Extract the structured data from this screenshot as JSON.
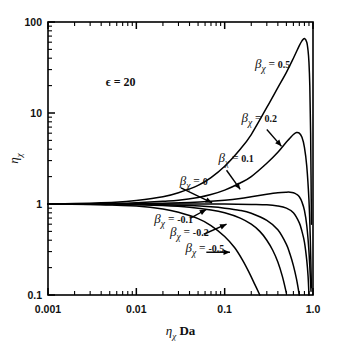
{
  "chart_data": {
    "type": "line",
    "title": "",
    "xlabel": "ηχ Da",
    "ylabel": "ηχ",
    "xscale": "log",
    "yscale": "log",
    "xlim": [
      0.001,
      1.0
    ],
    "ylim": [
      0.1,
      100
    ],
    "xticks": [
      "0.001",
      "0.01",
      "0.1",
      "1.0"
    ],
    "yticks": [
      "0.1",
      "1",
      "10",
      "100"
    ],
    "grid": false,
    "legend_position": "inline-annotations",
    "annotations": [
      {
        "name": "epsilon-annotation",
        "text": "ϵ = 20",
        "x": 0.0045,
        "y": 20
      },
      {
        "name": "beta-0.5-label",
        "text": "βχ = 0.5",
        "x": 0.22,
        "y": 31
      },
      {
        "name": "beta-0.2-label",
        "text": "βχ = 0.2",
        "x": 0.155,
        "y": 8.0
      },
      {
        "name": "beta-0.1-label",
        "text": "βχ = 0.1",
        "x": 0.085,
        "y": 2.9
      },
      {
        "name": "beta-0-label",
        "text": "βχ = 0",
        "x": 0.031,
        "y": 1.62
      },
      {
        "name": "beta-neg0.1-label",
        "text": "βχ = -0.1",
        "x": 0.016,
        "y": 0.62
      },
      {
        "name": "beta-neg0.2-label",
        "text": "βχ = -0.2",
        "x": 0.024,
        "y": 0.44
      },
      {
        "name": "beta-neg0.5-label",
        "text": "βχ = -0.5",
        "x": 0.036,
        "y": 0.295
      }
    ],
    "series": [
      {
        "name": "beta = 0.5",
        "label": "βχ = 0.5",
        "color": "#000000",
        "x": [
          0.001,
          0.002,
          0.004,
          0.007,
          0.01,
          0.02,
          0.03,
          0.05,
          0.07,
          0.1,
          0.15,
          0.2,
          0.3,
          0.4,
          0.5,
          0.6,
          0.7,
          0.75,
          0.8,
          0.85,
          0.88,
          0.9,
          0.92,
          0.94,
          0.96
        ],
        "y": [
          1.0,
          1.01,
          1.03,
          1.06,
          1.09,
          1.2,
          1.33,
          1.6,
          1.95,
          2.6,
          4.0,
          5.8,
          11.5,
          19,
          28,
          40,
          55,
          62,
          66,
          60,
          48,
          36,
          20,
          6,
          0.6
        ]
      },
      {
        "name": "beta = 0.2",
        "label": "βχ = 0.2",
        "color": "#000000",
        "x": [
          0.001,
          0.002,
          0.004,
          0.007,
          0.01,
          0.02,
          0.03,
          0.05,
          0.07,
          0.1,
          0.15,
          0.2,
          0.3,
          0.4,
          0.5,
          0.55,
          0.6,
          0.65,
          0.7,
          0.75,
          0.8,
          0.85,
          0.9,
          0.93,
          0.96
        ],
        "y": [
          1.0,
          1.0,
          1.01,
          1.02,
          1.03,
          1.07,
          1.1,
          1.18,
          1.27,
          1.42,
          1.7,
          2.0,
          2.8,
          3.7,
          4.8,
          5.3,
          5.8,
          6.1,
          6.0,
          5.4,
          4.2,
          2.6,
          1.1,
          0.45,
          0.12
        ]
      },
      {
        "name": "beta = 0.1",
        "label": "βχ = 0.1",
        "color": "#000000",
        "x": [
          0.001,
          0.002,
          0.005,
          0.01,
          0.02,
          0.04,
          0.07,
          0.1,
          0.15,
          0.2,
          0.3,
          0.4,
          0.5,
          0.55,
          0.6,
          0.65,
          0.7,
          0.75,
          0.8,
          0.85,
          0.9,
          0.95
        ],
        "y": [
          1.0,
          1.0,
          1.0,
          1.01,
          1.02,
          1.04,
          1.07,
          1.1,
          1.15,
          1.2,
          1.28,
          1.33,
          1.35,
          1.35,
          1.33,
          1.28,
          1.2,
          1.05,
          0.85,
          0.58,
          0.3,
          0.11
        ]
      },
      {
        "name": "beta = 0",
        "label": "βχ = 0",
        "color": "#000000",
        "x": [
          0.001,
          0.005,
          0.01,
          0.03,
          0.06,
          0.1,
          0.2,
          0.3,
          0.4,
          0.5,
          0.6,
          0.7,
          0.75,
          0.8,
          0.85,
          0.88,
          0.9
        ],
        "y": [
          1.0,
          1.0,
          1.0,
          1.0,
          1.0,
          1.0,
          0.99,
          0.98,
          0.95,
          0.9,
          0.8,
          0.62,
          0.5,
          0.38,
          0.24,
          0.16,
          0.1
        ]
      },
      {
        "name": "beta = -0.1",
        "label": "βχ = -0.1",
        "color": "#000000",
        "x": [
          0.001,
          0.005,
          0.01,
          0.02,
          0.04,
          0.07,
          0.1,
          0.15,
          0.2,
          0.3,
          0.4,
          0.5,
          0.55,
          0.6,
          0.65,
          0.7
        ],
        "y": [
          1.0,
          1.0,
          0.99,
          0.98,
          0.96,
          0.93,
          0.9,
          0.85,
          0.79,
          0.66,
          0.52,
          0.36,
          0.28,
          0.21,
          0.15,
          0.1
        ]
      },
      {
        "name": "beta = -0.2",
        "label": "βχ = -0.2",
        "color": "#000000",
        "x": [
          0.001,
          0.005,
          0.01,
          0.02,
          0.04,
          0.07,
          0.1,
          0.15,
          0.2,
          0.25,
          0.3,
          0.35,
          0.4,
          0.45,
          0.5
        ],
        "y": [
          1.0,
          0.99,
          0.98,
          0.96,
          0.92,
          0.86,
          0.8,
          0.7,
          0.6,
          0.5,
          0.4,
          0.31,
          0.23,
          0.16,
          0.105
        ]
      },
      {
        "name": "beta = -0.5",
        "label": "βχ = -0.5",
        "color": "#000000",
        "x": [
          0.001,
          0.003,
          0.006,
          0.01,
          0.02,
          0.03,
          0.05,
          0.07,
          0.1,
          0.13,
          0.16,
          0.19,
          0.22,
          0.25
        ],
        "y": [
          1.0,
          0.99,
          0.97,
          0.95,
          0.88,
          0.81,
          0.69,
          0.58,
          0.44,
          0.33,
          0.24,
          0.175,
          0.13,
          0.1
        ]
      }
    ]
  },
  "figure": {
    "background": "#ffffff",
    "line_color": "#000000",
    "axis_color": "#000000"
  }
}
